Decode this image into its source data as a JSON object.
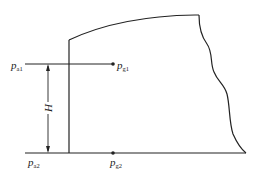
{
  "diagram": {
    "labels": {
      "pa1": {
        "main": "p",
        "sub": "a1"
      },
      "pg1": {
        "main": "p",
        "sub": "g1"
      },
      "pa2": {
        "main": "p",
        "sub": "a2"
      },
      "pg2": {
        "main": "p",
        "sub": "g2"
      },
      "height": "H"
    },
    "colors": {
      "line": "#222222",
      "background": "#ffffff"
    }
  }
}
